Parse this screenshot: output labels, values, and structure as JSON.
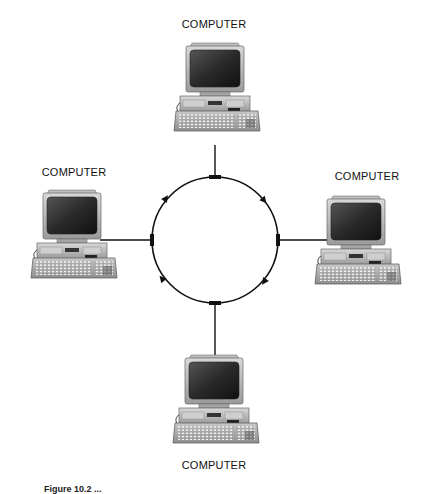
{
  "diagram": {
    "type": "ring-network-topology",
    "nodes": [
      {
        "id": "top",
        "label": "COMPUTER"
      },
      {
        "id": "left",
        "label": "COMPUTER"
      },
      {
        "id": "right",
        "label": "COMPUTER"
      },
      {
        "id": "bottom",
        "label": "COMPUTER"
      }
    ],
    "ring": {
      "direction": "clockwise",
      "arrows": 4
    },
    "caption": "Figure 10.2 (cut off)"
  },
  "caption_visible": "Figure 10.2 ..."
}
